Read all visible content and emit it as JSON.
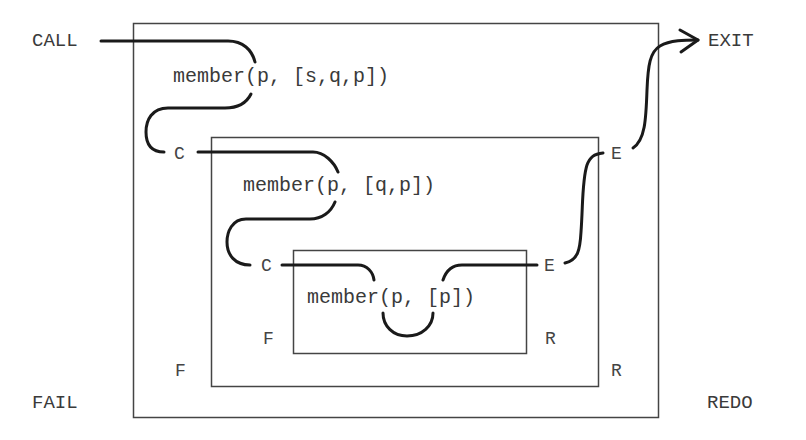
{
  "diagram": {
    "colors": {
      "stroke": "#1a1a1a",
      "box": "#444444",
      "text": "#3a3a3a"
    },
    "outer_ports": {
      "call": "CALL",
      "exit": "EXIT",
      "fail": "FAIL",
      "redo": "REDO"
    },
    "boxes": [
      {
        "level": 1,
        "goal": "member(p, [s,q,p])",
        "ports": {
          "call": "C",
          "exit": "E",
          "fail": "F",
          "redo": "R"
        }
      },
      {
        "level": 2,
        "goal": "member(p, [q,p])",
        "ports": {
          "call": "C",
          "exit": "E",
          "fail": "F",
          "redo": "R"
        }
      },
      {
        "level": 3,
        "goal": "member(p, [p])",
        "ports": {
          "call": "C",
          "exit": "E",
          "fail": "F",
          "redo": "R"
        }
      }
    ]
  }
}
